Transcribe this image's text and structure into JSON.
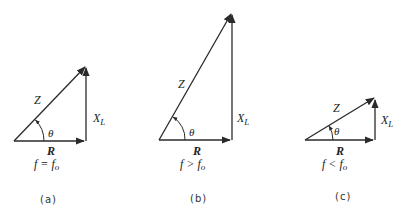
{
  "diagrams": [
    {
      "id": "a",
      "caption": "(a)",
      "condition": "f = f",
      "condition_sub": "o",
      "hypotenuse_label": "Z",
      "base_label": "R",
      "vertical_label": "X",
      "vertical_sub": "L",
      "angle_label": "θ"
    },
    {
      "id": "b",
      "caption": "(b)",
      "condition": "f > f",
      "condition_sub": "o",
      "hypotenuse_label": "Z",
      "base_label": "R",
      "vertical_label": "X",
      "vertical_sub": "L",
      "angle_label": "θ"
    },
    {
      "id": "c",
      "caption": "(c)",
      "condition": "f < f",
      "condition_sub": "o",
      "hypotenuse_label": "Z",
      "base_label": "R",
      "vertical_label": "X",
      "vertical_sub": "L",
      "angle_label": "θ"
    }
  ],
  "colors": {
    "ink": "#2a2a2a",
    "background": "#ffffff"
  }
}
